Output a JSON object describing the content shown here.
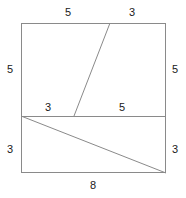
{
  "figure": {
    "type": "geometry-diagram",
    "stroke_color": "#8a8a8a",
    "label_color": "#1a1a1a",
    "background_color": "#ffffff",
    "outline": {
      "top_left": [
        21,
        23
      ],
      "top_right": [
        166,
        23
      ],
      "bottom_right": [
        166,
        173
      ],
      "bottom_left": [
        21,
        173
      ]
    },
    "divider": {
      "name": "horizontal-divider",
      "from": [
        21,
        116
      ],
      "to": [
        166,
        116
      ]
    },
    "upper_slant": {
      "name": "upper-slant-segment",
      "from": [
        110,
        23
      ],
      "to": [
        74,
        116
      ]
    },
    "lower_diagonal": {
      "name": "lower-diagonal-segment",
      "from": [
        21,
        116
      ],
      "to": [
        166,
        173
      ]
    },
    "labels": [
      {
        "id": "top-left-length",
        "text": "5",
        "x": 68,
        "y": 13
      },
      {
        "id": "top-right-length",
        "text": "3",
        "x": 132,
        "y": 13
      },
      {
        "id": "left-upper-length",
        "text": "5",
        "x": 10,
        "y": 70
      },
      {
        "id": "right-upper-length",
        "text": "5",
        "x": 175,
        "y": 70
      },
      {
        "id": "mid-left-length",
        "text": "3",
        "x": 48,
        "y": 108
      },
      {
        "id": "mid-right-length",
        "text": "5",
        "x": 122,
        "y": 108
      },
      {
        "id": "left-lower-length",
        "text": "3",
        "x": 10,
        "y": 150
      },
      {
        "id": "right-lower-length",
        "text": "3",
        "x": 175,
        "y": 150
      },
      {
        "id": "bottom-length",
        "text": "8",
        "x": 93,
        "y": 186
      }
    ]
  }
}
